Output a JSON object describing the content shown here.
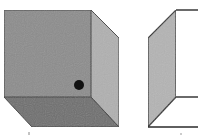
{
  "figure": {
    "colors": {
      "background": "#ffffff",
      "front_face": "#8c8c8c",
      "side_face": "#b0b0b0",
      "bottom_face": "#6e6e6e",
      "open_side_face": "#b4b4b4",
      "edge": "#3a3a3a",
      "dot": "#111111"
    },
    "left_cube": {
      "label": "",
      "front_face": {
        "x": 4,
        "y": 10,
        "width": 87,
        "height": 87
      },
      "depth_offset": {
        "dx": 28,
        "dy": 30
      },
      "dot": {
        "cx": 79,
        "cy": 85,
        "r": 5
      }
    },
    "right_box": {
      "label": "",
      "side_face_points": "148,38 176,10 176,97 148,127",
      "top_edge": {
        "x1": 176,
        "y1": 10,
        "x2": 198,
        "y2": 10
      },
      "inner_edge": {
        "x1": 176,
        "y1": 97,
        "x2": 198,
        "y2": 97
      },
      "bottom_edge": {
        "x1": 148,
        "y1": 127,
        "x2": 198,
        "y2": 127
      }
    }
  }
}
